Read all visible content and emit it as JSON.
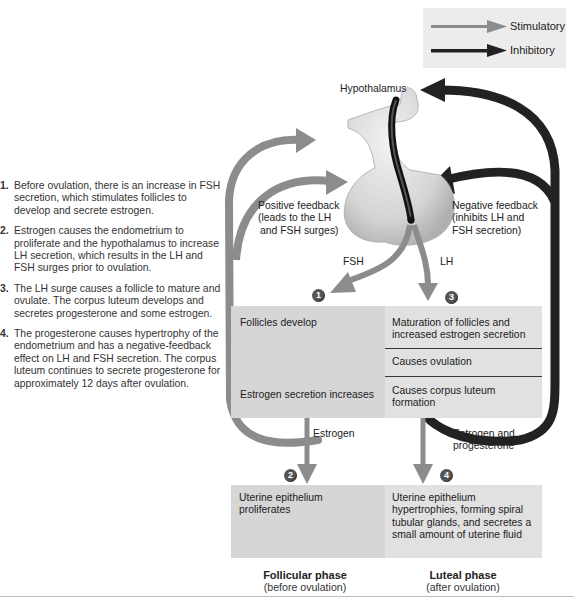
{
  "legend": {
    "stimulatory_label": "Stimulatory",
    "inhibitory_label": "Inhibitory",
    "stimulatory_color": "#8c8c8c",
    "inhibitory_color": "#222222"
  },
  "steps": [
    {
      "number": "1.",
      "text": "Before ovulation, there is an increase in FSH secretion, which stimulates follicles to develop and secrete estrogen."
    },
    {
      "number": "2.",
      "text": "Estrogen causes the endometrium to proliferate and the hypothalamus to increase LH secretion, which results in the LH and FSH surges prior to ovulation."
    },
    {
      "number": "3.",
      "text": "The LH surge causes a follicle to mature and ovulate. The corpus luteum develops and secretes progesterone and some estrogen."
    },
    {
      "number": "4.",
      "text": "The progesterone causes hypertrophy of the endometrium and has a negative-feedback effect on LH and FSH secretion. The corpus luteum continues to secrete progesterone for approximately 12 days after ovulation."
    }
  ],
  "diagram": {
    "hypothalamus_label": "Hypothalamus",
    "positive_feedback": [
      "Positive feedback",
      "(leads to the LH",
      "and FSH surges)"
    ],
    "negative_feedback": [
      "Negative feedback",
      "(inhibits LH and",
      "FSH secretion)"
    ],
    "fsh_label": "FSH",
    "lh_label": "LH",
    "estrogen_label": "Estrogen",
    "estrogen_progesterone_label": [
      "Estrogen and",
      "progesterone"
    ],
    "badges": [
      "1",
      "2",
      "3",
      "4"
    ]
  },
  "ovary_box": {
    "left": {
      "top_text": "Follicles develop",
      "bottom_text": "Estrogen secretion increases"
    },
    "right": [
      "Maturation of follicles and increased estrogen secretion",
      "Causes ovulation",
      "Causes corpus luteum formation"
    ]
  },
  "uterus_box": {
    "left": "Uterine epithelium proliferates",
    "right": "Uterine epithelium hypertrophies, forming spiral tubular glands, and secretes a small amount of uterine fluid"
  },
  "phases": {
    "follicular": {
      "title": "Follicular phase",
      "subtitle": "(before ovulation)"
    },
    "luteal": {
      "title": "Luteal phase",
      "subtitle": "(after ovulation)"
    }
  }
}
